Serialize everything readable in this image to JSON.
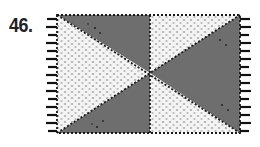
{
  "figure": {
    "number_label": "46.",
    "colors": {
      "dark": "#6e6e6e",
      "light": "#f2f2f2",
      "stroke": "#1a1a1a"
    }
  }
}
